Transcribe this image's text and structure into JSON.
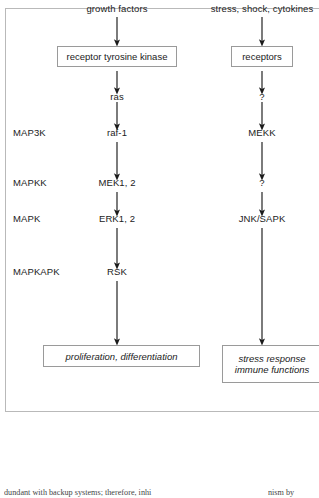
{
  "figure": {
    "type": "flow-diagram",
    "columns": [
      {
        "id": "left-pathway",
        "stimulus": "growth factors",
        "receptor_box": "receptor  tyrosine  kinase",
        "outcome_box": "proliferation,  differentiation"
      },
      {
        "id": "right-pathway",
        "stimulus": "stress, shock, cytokines",
        "receptor_box": "receptors",
        "outcome_box_line1": "stress response",
        "outcome_box_line2": "immune functions"
      }
    ],
    "tier_labels": [
      {
        "label": "MAP3K"
      },
      {
        "label": "MAPKK"
      },
      {
        "label": "MAPK"
      },
      {
        "label": "MAPKAPK"
      }
    ],
    "left_nodes": [
      {
        "label": "ras"
      },
      {
        "label": "raf-1"
      },
      {
        "label": "MEK1, 2"
      },
      {
        "label": "ERK1, 2"
      },
      {
        "label": "RSK"
      }
    ],
    "right_nodes": [
      {
        "label": "?"
      },
      {
        "label": "MEKK"
      },
      {
        "label": "?"
      },
      {
        "label": "JNK/SAPK"
      }
    ]
  },
  "page_text": {
    "fragment_left": "dundant with backup systems; therefore, inhi",
    "fragment_right": "nism  by"
  },
  "colors": {
    "frame_border": "#b9b9b9",
    "box_border": "#9a9a9a",
    "arrow": "#1b1b1b",
    "text": "#1b1b1b",
    "background": "#ffffff"
  }
}
